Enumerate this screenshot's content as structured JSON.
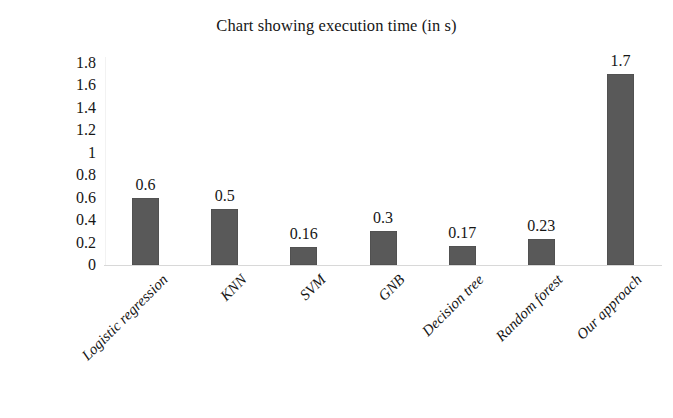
{
  "chart_data": {
    "type": "bar",
    "title": "Chart showing execution time (in s)",
    "xlabel": "",
    "ylabel": "",
    "categories": [
      "Logistic regression",
      "KNN",
      "SVM",
      "GNB",
      "Decision tree",
      "Random forest",
      "Our approach"
    ],
    "values": [
      0.6,
      0.5,
      0.16,
      0.3,
      0.17,
      0.23,
      1.7
    ],
    "value_labels": [
      "0.6",
      "0.5",
      "0.16",
      "0.3",
      "0.17",
      "0.23",
      "1.7"
    ],
    "ylim": [
      0,
      1.8
    ],
    "ytick_values": [
      0,
      0.2,
      0.4,
      0.6,
      0.8,
      1,
      1.2,
      1.4,
      1.6,
      1.8
    ],
    "ytick_labels": [
      "0",
      "0.2",
      "0.4",
      "0.6",
      "0.8",
      "1",
      "1.2",
      "1.4",
      "1.6",
      "1.8"
    ],
    "grid": false,
    "legend": false,
    "legend_position": "none",
    "bar_color": "#595959",
    "axis_color": "#d8d8d8",
    "text_color": "#161616",
    "background_color": "#ffffff",
    "xtick_rotation": -45
  }
}
